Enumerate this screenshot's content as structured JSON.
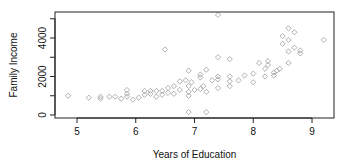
{
  "chart_data": {
    "type": "scatter",
    "title": "",
    "xlabel": "Years of Education",
    "ylabel": "Family Income",
    "xlim": [
      4.62,
      9.4
    ],
    "ylim": [
      -150,
      5350
    ],
    "xticks": [
      5,
      6,
      7,
      8,
      9
    ],
    "xtick_labels": [
      "5",
      "6",
      "7",
      "8",
      "9"
    ],
    "yticks": [
      0,
      1000,
      2000,
      3000,
      4000,
      5000
    ],
    "ytick_labels": [
      "0",
      "",
      "2000",
      "",
      "4000",
      ""
    ],
    "grid": false,
    "legend": null,
    "marker": "diamond-open",
    "marker_color": "#9a9a9a",
    "points": [
      {
        "x": 4.85,
        "y": 1000
      },
      {
        "x": 5.2,
        "y": 900
      },
      {
        "x": 5.4,
        "y": 850
      },
      {
        "x": 5.4,
        "y": 950
      },
      {
        "x": 5.55,
        "y": 950
      },
      {
        "x": 5.65,
        "y": 950
      },
      {
        "x": 5.75,
        "y": 850
      },
      {
        "x": 5.85,
        "y": 950
      },
      {
        "x": 5.85,
        "y": 1100
      },
      {
        "x": 5.85,
        "y": 1300
      },
      {
        "x": 5.95,
        "y": 800
      },
      {
        "x": 6.05,
        "y": 900
      },
      {
        "x": 6.15,
        "y": 1050
      },
      {
        "x": 6.15,
        "y": 1250
      },
      {
        "x": 6.25,
        "y": 1250
      },
      {
        "x": 6.25,
        "y": 1100
      },
      {
        "x": 6.35,
        "y": 950
      },
      {
        "x": 6.35,
        "y": 1250
      },
      {
        "x": 6.45,
        "y": 1050
      },
      {
        "x": 6.45,
        "y": 1250
      },
      {
        "x": 6.55,
        "y": 1150
      },
      {
        "x": 6.55,
        "y": 1400
      },
      {
        "x": 6.5,
        "y": 3400
      },
      {
        "x": 6.65,
        "y": 1100
      },
      {
        "x": 6.65,
        "y": 1500
      },
      {
        "x": 6.75,
        "y": 1300
      },
      {
        "x": 6.75,
        "y": 1750
      },
      {
        "x": 6.85,
        "y": 1800
      },
      {
        "x": 6.9,
        "y": 1500
      },
      {
        "x": 6.9,
        "y": 1200
      },
      {
        "x": 6.9,
        "y": 1000
      },
      {
        "x": 6.9,
        "y": 2300
      },
      {
        "x": 6.9,
        "y": 150
      },
      {
        "x": 6.95,
        "y": 1700
      },
      {
        "x": 7.0,
        "y": 1300
      },
      {
        "x": 7.1,
        "y": 1350
      },
      {
        "x": 7.1,
        "y": 1950
      },
      {
        "x": 7.1,
        "y": 2100
      },
      {
        "x": 7.15,
        "y": 1500
      },
      {
        "x": 7.2,
        "y": 1200
      },
      {
        "x": 7.2,
        "y": 2350
      },
      {
        "x": 7.2,
        "y": 150
      },
      {
        "x": 7.3,
        "y": 1800
      },
      {
        "x": 7.4,
        "y": 5200
      },
      {
        "x": 7.4,
        "y": 3000
      },
      {
        "x": 7.4,
        "y": 2000
      },
      {
        "x": 7.4,
        "y": 1850
      },
      {
        "x": 7.4,
        "y": 1400
      },
      {
        "x": 7.6,
        "y": 2900
      },
      {
        "x": 7.6,
        "y": 2000
      },
      {
        "x": 7.6,
        "y": 1750
      },
      {
        "x": 7.6,
        "y": 1500
      },
      {
        "x": 7.75,
        "y": 1800
      },
      {
        "x": 7.85,
        "y": 2050
      },
      {
        "x": 8.0,
        "y": 1700
      },
      {
        "x": 8.0,
        "y": 2150
      },
      {
        "x": 8.1,
        "y": 2700
      },
      {
        "x": 8.2,
        "y": 2000
      },
      {
        "x": 8.2,
        "y": 2400
      },
      {
        "x": 8.25,
        "y": 2600
      },
      {
        "x": 8.25,
        "y": 2800
      },
      {
        "x": 8.35,
        "y": 2200
      },
      {
        "x": 8.35,
        "y": 2050
      },
      {
        "x": 8.4,
        "y": 2300
      },
      {
        "x": 8.45,
        "y": 2400
      },
      {
        "x": 8.5,
        "y": 3700
      },
      {
        "x": 8.5,
        "y": 4100
      },
      {
        "x": 8.6,
        "y": 2700
      },
      {
        "x": 8.6,
        "y": 3300
      },
      {
        "x": 8.6,
        "y": 3900
      },
      {
        "x": 8.6,
        "y": 4500
      },
      {
        "x": 8.7,
        "y": 3500
      },
      {
        "x": 8.7,
        "y": 4300
      },
      {
        "x": 8.8,
        "y": 3200
      },
      {
        "x": 8.8,
        "y": 3350
      },
      {
        "x": 9.2,
        "y": 3900
      }
    ]
  }
}
